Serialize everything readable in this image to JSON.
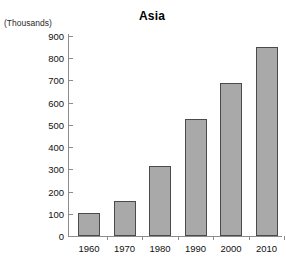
{
  "chart_data": {
    "type": "bar",
    "title": "Asia",
    "xlabel": "",
    "ylabel": "(Thousands)",
    "categories": [
      "1960",
      "1970",
      "1980",
      "1990",
      "2000",
      "2010"
    ],
    "values": [
      105,
      158,
      315,
      525,
      690,
      852
    ],
    "ylim": [
      0,
      900
    ],
    "ytick_step": 100,
    "yticks": [
      "900",
      "800",
      "700",
      "600",
      "500",
      "400",
      "300",
      "200",
      "100",
      "0"
    ],
    "grid": false,
    "legend": false,
    "legend_position": "none",
    "series": [
      {
        "name": "Asia",
        "values": [
          105,
          158,
          315,
          525,
          690,
          852
        ]
      }
    ],
    "colors": {
      "bar_fill": "#a9a9a9",
      "bar_border": "#4a4a4a",
      "axis": "#8c8c8c",
      "text": "#111111",
      "background": "#ffffff"
    }
  }
}
